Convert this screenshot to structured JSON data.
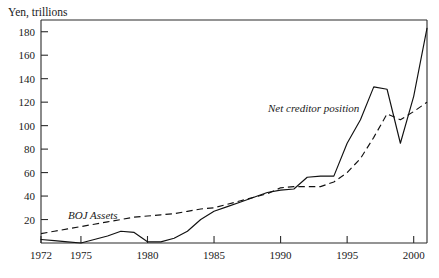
{
  "figure": {
    "y_axis_title": "Yen, trillions",
    "background": "#ffffff",
    "ink_color": "#111111"
  },
  "labels": {
    "net_creditor": "Net creditor position",
    "boj_assets": "BOJ Assets"
  },
  "chart_data": {
    "type": "line",
    "title": "",
    "subtitle": "",
    "xlabel": "",
    "ylabel": "Yen, trillions",
    "xlim": [
      1972,
      2001
    ],
    "ylim": [
      0,
      190
    ],
    "grid": false,
    "legend": "inline-annotations",
    "xticks": [
      1972,
      1975,
      1980,
      1985,
      1990,
      1995,
      2000
    ],
    "xtick_labels": [
      "1972",
      "1975",
      "1980",
      "1985",
      "1990",
      "1995",
      "2000"
    ],
    "yticks": [
      20,
      40,
      60,
      80,
      100,
      120,
      140,
      160,
      180
    ],
    "ytick_labels": [
      "20",
      "40",
      "60",
      "80",
      "100",
      "120",
      "140",
      "160",
      "180"
    ],
    "x": [
      1972,
      1973,
      1974,
      1975,
      1976,
      1977,
      1978,
      1979,
      1980,
      1981,
      1982,
      1983,
      1984,
      1985,
      1986,
      1987,
      1988,
      1989,
      1990,
      1991,
      1992,
      1993,
      1994,
      1995,
      1996,
      1997,
      1998,
      1999,
      2000,
      2001
    ],
    "series": [
      {
        "name": "Net creditor position",
        "style": "solid",
        "annotation": "Net creditor position",
        "values": [
          3,
          2,
          1,
          0,
          3,
          6,
          10,
          9,
          1,
          1,
          4,
          10,
          20,
          27,
          31,
          35,
          39,
          43,
          45,
          46,
          56,
          57,
          57,
          85,
          105,
          133,
          131,
          85,
          125,
          183
        ]
      },
      {
        "name": "BOJ Assets",
        "style": "dashed",
        "annotation": "BOJ Assets",
        "values": [
          8,
          10,
          12,
          14,
          16,
          18,
          20,
          22,
          23,
          24,
          25,
          27,
          29,
          30,
          33,
          36,
          39,
          42,
          47,
          48,
          48,
          48,
          52,
          60,
          72,
          90,
          110,
          105,
          112,
          120
        ]
      }
    ]
  }
}
